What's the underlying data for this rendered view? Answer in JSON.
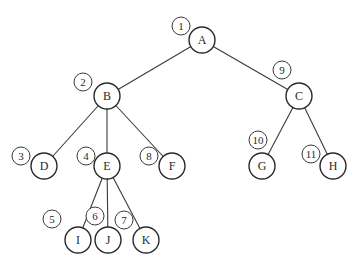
{
  "diagram": {
    "type": "tree",
    "nodes": [
      {
        "id": "A",
        "label": "A",
        "x": 202,
        "y": 40,
        "order": "1",
        "ox": 181,
        "oy": 26
      },
      {
        "id": "B",
        "label": "B",
        "x": 107,
        "y": 96,
        "order": "2",
        "ox": 83,
        "oy": 82
      },
      {
        "id": "C",
        "label": "C",
        "x": 299,
        "y": 96,
        "order": "9",
        "ox": 282,
        "oy": 70
      },
      {
        "id": "D",
        "label": "D",
        "x": 44,
        "y": 166,
        "order": "3",
        "ox": 21,
        "oy": 156
      },
      {
        "id": "E",
        "label": "E",
        "x": 107,
        "y": 166,
        "order": "4",
        "ox": 86,
        "oy": 156
      },
      {
        "id": "F",
        "label": "F",
        "x": 172,
        "y": 166,
        "order": "8",
        "ox": 149,
        "oy": 156
      },
      {
        "id": "G",
        "label": "G",
        "x": 262,
        "y": 166,
        "order": "10",
        "ox": 258,
        "oy": 140
      },
      {
        "id": "H",
        "label": "H",
        "x": 333,
        "y": 166,
        "order": "11",
        "ox": 311,
        "oy": 154
      },
      {
        "id": "I",
        "label": "I",
        "x": 78,
        "y": 240,
        "order": "5",
        "ox": 52,
        "oy": 219
      },
      {
        "id": "J",
        "label": "J",
        "x": 108,
        "y": 240,
        "order": "6",
        "ox": 95,
        "oy": 216
      },
      {
        "id": "K",
        "label": "K",
        "x": 146,
        "y": 240,
        "order": "7",
        "ox": 124,
        "oy": 220
      }
    ],
    "edges": [
      [
        "A",
        "B"
      ],
      [
        "A",
        "C"
      ],
      [
        "B",
        "D"
      ],
      [
        "B",
        "E"
      ],
      [
        "B",
        "F"
      ],
      [
        "C",
        "G"
      ],
      [
        "C",
        "H"
      ],
      [
        "E",
        "I"
      ],
      [
        "E",
        "J"
      ],
      [
        "E",
        "K"
      ]
    ]
  }
}
